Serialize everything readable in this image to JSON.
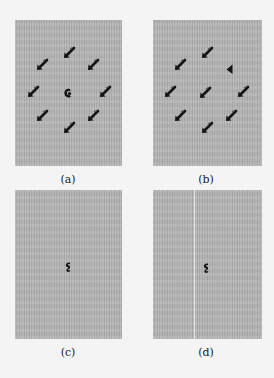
{
  "figure": {
    "panels": [
      {
        "id": "a",
        "caption": "(a)",
        "box": {
          "left": 15,
          "top": 20,
          "width": 107,
          "height": 146
        },
        "marks": [
          {
            "type": "arrow",
            "x": 69,
            "y": 53
          },
          {
            "type": "arrow",
            "x": 42,
            "y": 65
          },
          {
            "type": "arrow",
            "x": 93,
            "y": 65
          },
          {
            "type": "arrow",
            "x": 33,
            "y": 92
          },
          {
            "type": "blob",
            "x": 68,
            "y": 93
          },
          {
            "type": "arrow",
            "x": 105,
            "y": 92
          },
          {
            "type": "arrow",
            "x": 42,
            "y": 116
          },
          {
            "type": "arrow",
            "x": 93,
            "y": 116
          },
          {
            "type": "arrow",
            "x": 69,
            "y": 128
          }
        ]
      },
      {
        "id": "b",
        "caption": "(b)",
        "box": {
          "left": 153,
          "top": 20,
          "width": 109,
          "height": 146
        },
        "marks": [
          {
            "type": "arrow",
            "x": 207,
            "y": 53
          },
          {
            "type": "arrow",
            "x": 180,
            "y": 65
          },
          {
            "type": "triangle",
            "x": 230,
            "y": 69
          },
          {
            "type": "arrow",
            "x": 170,
            "y": 92
          },
          {
            "type": "arrow",
            "x": 205,
            "y": 93
          },
          {
            "type": "arrow",
            "x": 243,
            "y": 92
          },
          {
            "type": "arrow",
            "x": 180,
            "y": 116
          },
          {
            "type": "arrow",
            "x": 231,
            "y": 116
          },
          {
            "type": "arrow",
            "x": 207,
            "y": 128
          }
        ]
      },
      {
        "id": "c",
        "caption": "(c)",
        "box": {
          "left": 15,
          "top": 190,
          "width": 107,
          "height": 149
        },
        "marks": [
          {
            "type": "spot",
            "x": 68,
            "y": 267
          }
        ]
      },
      {
        "id": "d",
        "caption": "(d)",
        "box": {
          "left": 153,
          "top": 190,
          "width": 109,
          "height": 149
        },
        "streak_x": 194,
        "marks": [
          {
            "type": "spot",
            "x": 206,
            "y": 268
          }
        ]
      }
    ],
    "captions": {
      "a": {
        "text": "(a)",
        "x": 68,
        "y": 173
      },
      "b": {
        "text": "(b)",
        "x": 206,
        "y": 173
      },
      "c": {
        "text": "(c)",
        "x": 68,
        "y": 346
      },
      "d": {
        "text": "(d)",
        "x": 206,
        "y": 346
      }
    },
    "colors": {
      "panel_bg": "#b5b5b5",
      "page_bg": "#f4f4f4",
      "mark": "#141414"
    }
  }
}
